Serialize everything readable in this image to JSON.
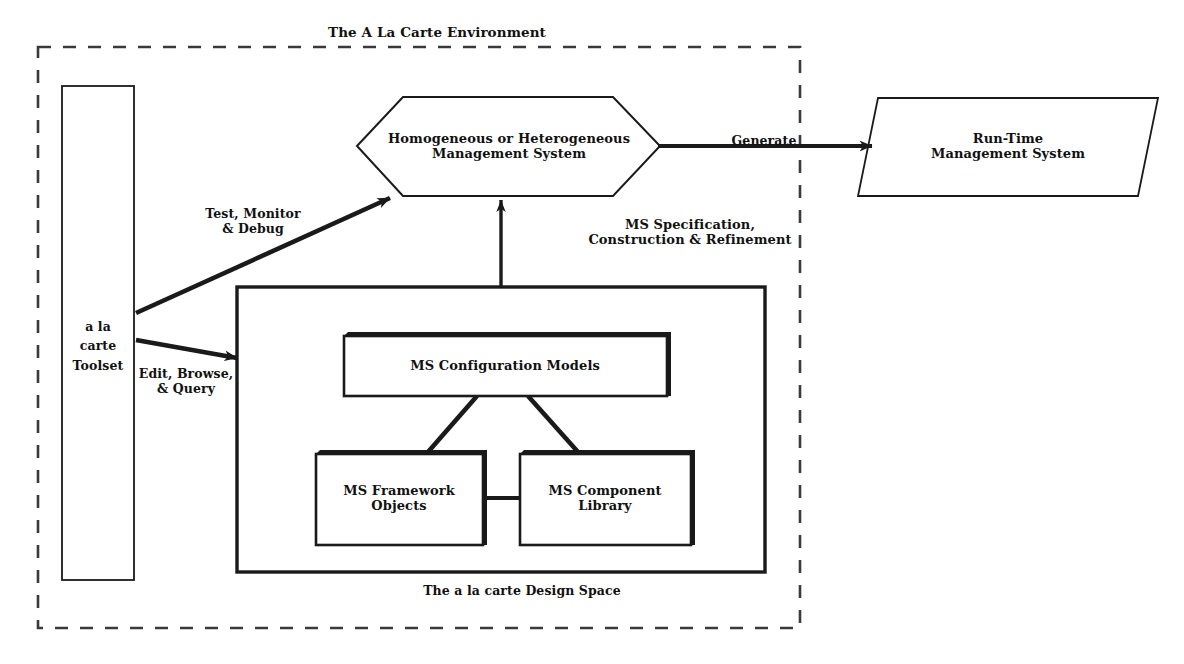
{
  "diagram": {
    "title": "The A La Carte Environment",
    "boundary_label": "The A La Carte Environment",
    "nodes": {
      "toolset": {
        "label": "a la\ncarte\nToolset",
        "shape": "rectangle"
      },
      "management_system": {
        "label": "Homogeneous or Heterogeneous\nManagement System",
        "shape": "hexagon"
      },
      "runtime_system": {
        "label": "Run-Time\nManagement System",
        "shape": "parallelogram"
      },
      "design_space": {
        "label": "The a la carte Design Space",
        "shape": "rectangle"
      },
      "config_models": {
        "label": "MS Configuration Models",
        "shape": "rectangle-3d"
      },
      "framework_objects": {
        "label": "MS Framework\nObjects",
        "shape": "rectangle-3d"
      },
      "component_library": {
        "label": "MS Component\nLibrary",
        "shape": "rectangle-3d"
      }
    },
    "edges": {
      "test_monitor_debug": {
        "label": "Test, Monitor\n& Debug",
        "from": "toolset",
        "to": "management_system"
      },
      "edit_browse_query": {
        "label": "Edit, Browse,\n& Query",
        "from": "toolset",
        "to": "design_space"
      },
      "generate": {
        "label": "Generate",
        "from": "management_system",
        "to": "runtime_system"
      },
      "ms_spec": {
        "label": "MS Specification,\nConstruction & Refinement",
        "from": "design_space",
        "to": "management_system"
      }
    },
    "colors": {
      "stroke": "#1a1a1a",
      "fill": "#ffffff",
      "text": "#111111"
    }
  }
}
